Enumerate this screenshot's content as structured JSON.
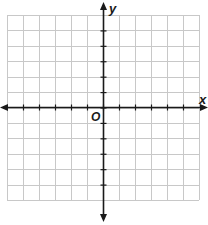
{
  "diagram": {
    "type": "coordinate-plane",
    "x_axis_label": "x",
    "y_axis_label": "y",
    "origin_label": "O",
    "grid": {
      "columns": 12,
      "rows": 12,
      "x_min": -6,
      "x_max": 6,
      "y_min": -6,
      "y_max": 6,
      "gridline_color": "#c8c8c8",
      "axis_color": "#1a1a1a"
    }
  }
}
